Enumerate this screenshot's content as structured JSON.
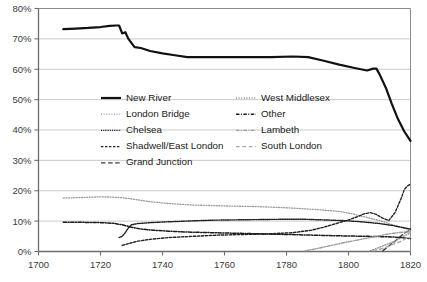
{
  "chart_data": {
    "type": "line",
    "title": "",
    "subtitle": "",
    "xlabel": "",
    "ylabel": "",
    "xlim": [
      1700,
      1820
    ],
    "ylim": [
      0,
      80
    ],
    "xticks": [
      1700,
      1720,
      1740,
      1760,
      1780,
      1800,
      1820
    ],
    "xtick_labels": [
      "1700",
      "1720",
      "1740",
      "1760",
      "1780",
      "1800",
      "1820"
    ],
    "yticks": [
      0,
      10,
      20,
      30,
      40,
      50,
      60,
      70,
      80
    ],
    "ytick_labels": [
      "0%",
      "10%",
      "20%",
      "30%",
      "40%",
      "50%",
      "60%",
      "70%",
      "80%"
    ],
    "grid": "horizontal",
    "legend_position": "center-upper",
    "series": [
      {
        "name": "New River",
        "style": "solid",
        "color": "#111111",
        "width": 2.2,
        "points": [
          [
            1708,
            73.2
          ],
          [
            1712,
            73.4
          ],
          [
            1716,
            73.6
          ],
          [
            1720,
            73.9
          ],
          [
            1723,
            74.3
          ],
          [
            1725,
            74.4
          ],
          [
            1726,
            74.4
          ],
          [
            1727,
            71.8
          ],
          [
            1728,
            72.2
          ],
          [
            1729,
            70.0
          ],
          [
            1731,
            67.3
          ],
          [
            1733,
            67.0
          ],
          [
            1736,
            66.0
          ],
          [
            1740,
            65.2
          ],
          [
            1744,
            64.6
          ],
          [
            1748,
            64.0
          ],
          [
            1755,
            64.0
          ],
          [
            1765,
            64.0
          ],
          [
            1775,
            64.0
          ],
          [
            1782,
            64.2
          ],
          [
            1787,
            64.0
          ],
          [
            1792,
            62.8
          ],
          [
            1797,
            61.5
          ],
          [
            1802,
            60.4
          ],
          [
            1806,
            59.6
          ],
          [
            1808,
            60.2
          ],
          [
            1809,
            60.2
          ],
          [
            1810,
            58.4
          ],
          [
            1812,
            54.0
          ],
          [
            1814,
            48.5
          ],
          [
            1816,
            43.5
          ],
          [
            1818,
            39.5
          ],
          [
            1820,
            36.4
          ]
        ]
      },
      {
        "name": "London Bridge",
        "style": "dotted-fine",
        "color": "#9a9a9a",
        "width": 1.3,
        "points": [
          [
            1708,
            17.6
          ],
          [
            1715,
            17.8
          ],
          [
            1720,
            18.0
          ],
          [
            1724,
            17.9
          ],
          [
            1728,
            17.6
          ],
          [
            1732,
            17.0
          ],
          [
            1736,
            16.4
          ],
          [
            1740,
            16.0
          ],
          [
            1745,
            15.6
          ],
          [
            1750,
            15.3
          ],
          [
            1760,
            15.0
          ],
          [
            1770,
            14.8
          ],
          [
            1780,
            14.4
          ],
          [
            1790,
            13.8
          ],
          [
            1797,
            13.2
          ],
          [
            1802,
            12.2
          ],
          [
            1806,
            11.2
          ],
          [
            1810,
            10.2
          ],
          [
            1813,
            9.2
          ],
          [
            1816,
            8.2
          ],
          [
            1818,
            7.6
          ],
          [
            1820,
            7.0
          ]
        ]
      },
      {
        "name": "Chelsea",
        "style": "dotted-dense",
        "color": "#1d1d1d",
        "width": 1.4,
        "points": [
          [
            1726,
            4.6
          ],
          [
            1727,
            5.0
          ],
          [
            1728,
            6.2
          ],
          [
            1729,
            7.8
          ],
          [
            1730,
            8.8
          ],
          [
            1732,
            9.2
          ],
          [
            1736,
            9.5
          ],
          [
            1740,
            9.7
          ],
          [
            1745,
            9.9
          ],
          [
            1750,
            10.1
          ],
          [
            1756,
            10.3
          ],
          [
            1762,
            10.4
          ],
          [
            1770,
            10.5
          ],
          [
            1778,
            10.6
          ],
          [
            1786,
            10.6
          ],
          [
            1792,
            10.4
          ],
          [
            1798,
            10.2
          ],
          [
            1804,
            9.8
          ],
          [
            1810,
            9.2
          ],
          [
            1814,
            8.6
          ],
          [
            1817,
            8.0
          ],
          [
            1820,
            7.4
          ]
        ]
      },
      {
        "name": "Shadwell/East London",
        "style": "dashed-short",
        "color": "#222222",
        "width": 1.4,
        "points": [
          [
            1727,
            2.0
          ],
          [
            1729,
            2.6
          ],
          [
            1732,
            3.4
          ],
          [
            1736,
            4.0
          ],
          [
            1742,
            4.6
          ],
          [
            1750,
            5.0
          ],
          [
            1758,
            5.4
          ],
          [
            1766,
            5.6
          ],
          [
            1774,
            5.8
          ],
          [
            1782,
            6.2
          ],
          [
            1788,
            7.0
          ],
          [
            1792,
            8.0
          ],
          [
            1796,
            9.2
          ],
          [
            1800,
            10.4
          ],
          [
            1803,
            11.5
          ],
          [
            1805,
            12.4
          ],
          [
            1807,
            12.8
          ],
          [
            1809,
            12.2
          ],
          [
            1811,
            11.0
          ],
          [
            1813,
            10.2
          ],
          [
            1815,
            12.8
          ],
          [
            1817,
            17.5
          ],
          [
            1818,
            20.4
          ],
          [
            1819,
            21.6
          ],
          [
            1820,
            22.2
          ]
        ]
      },
      {
        "name": "Grand Junction",
        "style": "dashed-long",
        "color": "#3a3a3a",
        "width": 1.3,
        "points": [
          [
            1811,
            0.2
          ],
          [
            1813,
            1.8
          ],
          [
            1815,
            3.4
          ],
          [
            1816,
            4.4
          ],
          [
            1817,
            5.2
          ],
          [
            1818,
            6.0
          ],
          [
            1819,
            6.6
          ],
          [
            1820,
            7.0
          ]
        ]
      },
      {
        "name": "West Middlesex",
        "style": "dotted-fine",
        "color": "#8d8d8d",
        "width": 1.3,
        "points": [
          [
            1807,
            0.2
          ],
          [
            1809,
            1.0
          ],
          [
            1811,
            1.8
          ],
          [
            1813,
            2.6
          ],
          [
            1815,
            3.4
          ],
          [
            1816,
            4.0
          ],
          [
            1817,
            4.6
          ],
          [
            1818,
            5.2
          ],
          [
            1819,
            5.6
          ],
          [
            1820,
            6.0
          ]
        ]
      },
      {
        "name": "Other",
        "style": "dash-dot",
        "color": "#1a1a1a",
        "width": 1.5,
        "points": [
          [
            1708,
            9.6
          ],
          [
            1714,
            9.6
          ],
          [
            1720,
            9.5
          ],
          [
            1724,
            9.3
          ],
          [
            1727,
            8.8
          ],
          [
            1730,
            8.0
          ],
          [
            1733,
            7.4
          ],
          [
            1737,
            7.0
          ],
          [
            1742,
            6.7
          ],
          [
            1748,
            6.4
          ],
          [
            1756,
            6.2
          ],
          [
            1764,
            6.0
          ],
          [
            1772,
            5.8
          ],
          [
            1780,
            5.6
          ],
          [
            1788,
            5.4
          ],
          [
            1795,
            5.2
          ],
          [
            1800,
            5.1
          ],
          [
            1806,
            5.0
          ],
          [
            1810,
            4.9
          ],
          [
            1814,
            4.8
          ],
          [
            1817,
            4.6
          ],
          [
            1820,
            4.2
          ]
        ]
      },
      {
        "name": "Lambeth",
        "style": "dash-dot-light",
        "color": "#9d9d9d",
        "width": 1.4,
        "points": [
          [
            1786,
            0.2
          ],
          [
            1790,
            1.0
          ],
          [
            1794,
            1.9
          ],
          [
            1798,
            2.8
          ],
          [
            1802,
            3.6
          ],
          [
            1806,
            4.4
          ],
          [
            1810,
            5.2
          ],
          [
            1813,
            5.8
          ],
          [
            1816,
            6.2
          ],
          [
            1818,
            6.4
          ],
          [
            1820,
            6.4
          ]
        ]
      },
      {
        "name": "South London",
        "style": "dashed-gray",
        "color": "#a8a8a8",
        "width": 1.4,
        "points": [
          [
            1808,
            0.2
          ],
          [
            1811,
            1.0
          ],
          [
            1813,
            1.8
          ],
          [
            1815,
            2.6
          ],
          [
            1817,
            3.4
          ],
          [
            1818,
            4.0
          ],
          [
            1819,
            4.4
          ],
          [
            1820,
            4.6
          ]
        ]
      }
    ]
  },
  "legend": {
    "column1": [
      {
        "label": "New River",
        "style": "solid"
      },
      {
        "label": "London Bridge",
        "style": "dotted-fine"
      },
      {
        "label": "Chelsea",
        "style": "dotted-dense"
      },
      {
        "label": "Shadwell/East London",
        "style": "dashed-short"
      },
      {
        "label": "Grand Junction",
        "style": "dashed-long"
      }
    ],
    "column2": [
      {
        "label": "West Middlesex",
        "style": "dotted-fine"
      },
      {
        "label": "Other",
        "style": "dash-dot"
      },
      {
        "label": "Lambeth",
        "style": "dash-dot-light"
      },
      {
        "label": "South London",
        "style": "dashed-gray"
      }
    ]
  },
  "colors": {
    "axis": "#6e6e6e",
    "grid": "#bdbdbd",
    "text": "#2b2b2b",
    "background": "#ffffff"
  }
}
